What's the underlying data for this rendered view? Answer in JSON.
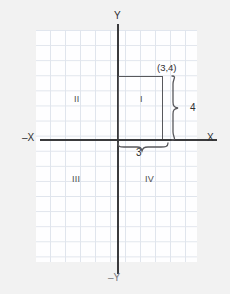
{
  "diagram": {
    "axes": {
      "x_positive_label": "X",
      "x_negative_label": "–X",
      "y_positive_label": "Y",
      "y_negative_label": "–Y",
      "axis_color": "#3a3a3c"
    },
    "grid": {
      "cell_size_px": 15,
      "line_color": "#d8dee8",
      "background": "#fefeff",
      "visible": true
    },
    "quadrants": [
      {
        "id": "I",
        "label": "I",
        "position": "upper-right"
      },
      {
        "id": "II",
        "label": "II",
        "position": "upper-left"
      },
      {
        "id": "III",
        "label": "III",
        "position": "lower-left"
      },
      {
        "id": "IV",
        "label": "IV",
        "position": "lower-right"
      }
    ],
    "point": {
      "label": "(3,4)",
      "x": 3,
      "y": 4
    },
    "rectangle": {
      "stroke_color": "#58585c",
      "from": "origin",
      "to": "(3,4)"
    },
    "dimensions": [
      {
        "id": "height",
        "label": "4",
        "orientation": "vertical",
        "brace": "right"
      },
      {
        "id": "width",
        "label": "3",
        "orientation": "horizontal",
        "brace": "bottom"
      }
    ]
  }
}
